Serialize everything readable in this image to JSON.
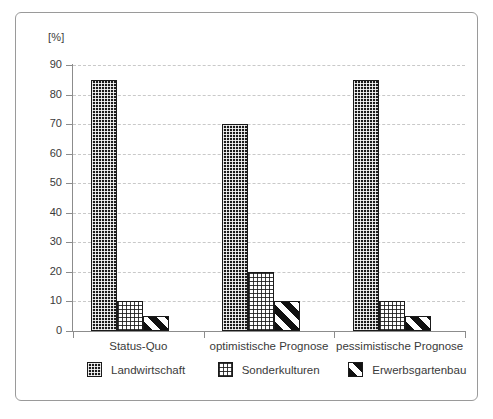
{
  "chart_data": {
    "type": "bar",
    "title": "",
    "subtitle": "",
    "xlabel": "",
    "ylabel": "[%]",
    "ylim": [
      0,
      90
    ],
    "ytick_step": 10,
    "yticks": [
      0,
      10,
      20,
      30,
      40,
      50,
      60,
      70,
      80,
      90
    ],
    "grid": true,
    "grid_axis": "y",
    "grid_style": "dashed",
    "legend_position": "bottom",
    "categories": [
      "Status-Quo",
      "optimistische Prognose",
      "pessimistische Prognose"
    ],
    "series": [
      {
        "name": "Landwirtschaft",
        "pattern": "dense-dotted-dark",
        "values": [
          85,
          70,
          85
        ]
      },
      {
        "name": "Sonderkulturen",
        "pattern": "light-dotted",
        "values": [
          10,
          20,
          10
        ]
      },
      {
        "name": "Erwerbsgartenbau",
        "pattern": "diagonal-stripes",
        "values": [
          5,
          10,
          5
        ]
      }
    ]
  },
  "axis": {
    "y_unit_label": "[%]",
    "y_tick_labels": [
      "90",
      "80",
      "70",
      "60",
      "50",
      "40",
      "30",
      "20",
      "10",
      "0"
    ]
  },
  "legend": {
    "items": [
      {
        "label": "Landwirtschaft"
      },
      {
        "label": "Sonderkulturen"
      },
      {
        "label": "Erwerbsgartenbau"
      }
    ]
  },
  "colors": {
    "frame": "#9a9a9a",
    "axis": "#8c8c8c",
    "gridline": "#c9c9c9",
    "text": "#3a3a3a",
    "bar_dark": "#1b1b1b",
    "bar_light": "#ffffff",
    "bar_stripe": "#111111",
    "background": "#ffffff"
  }
}
